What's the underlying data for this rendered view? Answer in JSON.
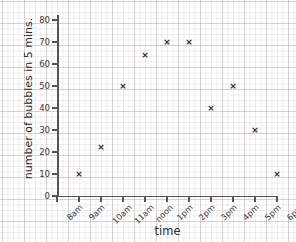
{
  "chart_data": {
    "type": "scatter",
    "title": "",
    "xlabel": "time",
    "ylabel": "number of bubbles in 5 mins.",
    "categories": [
      "8am",
      "9am",
      "10am",
      "11am",
      "noon",
      "1pm",
      "2pm",
      "3pm",
      "4pm",
      "5pm",
      "6pm"
    ],
    "values": [
      null,
      10,
      22,
      50,
      64,
      70,
      70,
      40,
      50,
      30,
      10
    ],
    "points": [
      {
        "x": "9am",
        "y": 10
      },
      {
        "x": "10am",
        "y": 22
      },
      {
        "x": "11am",
        "y": 50
      },
      {
        "x": "noon",
        "y": 64
      },
      {
        "x": "1pm",
        "y": 70
      },
      {
        "x": "2pm",
        "y": 70
      },
      {
        "x": "3pm",
        "y": 40
      },
      {
        "x": "4pm",
        "y": 50
      },
      {
        "x": "5pm",
        "y": 30
      },
      {
        "x": "6pm",
        "y": 10
      }
    ],
    "ylim": [
      0,
      80
    ],
    "ytick_labels": [
      "0",
      "10",
      "20",
      "30",
      "40",
      "50",
      "60",
      "70",
      "80"
    ],
    "ytick_values": [
      0,
      10,
      20,
      30,
      40,
      50,
      60,
      70,
      80
    ],
    "xtick_labels": [
      "8am",
      "9am",
      "10am",
      "11am",
      "noon",
      "1pm",
      "2pm",
      "3pm",
      "4pm",
      "5pm",
      "6pm"
    ],
    "grid": true,
    "legend": null,
    "marker": "x",
    "marker_glyph": "×",
    "colors": {
      "marker": "#2b2b2b",
      "axis": "#555555",
      "grid_major": "#af9ba2",
      "grid_minor": "#beaaaf",
      "background": "#ffffff",
      "text": "#2b2b2b"
    }
  }
}
